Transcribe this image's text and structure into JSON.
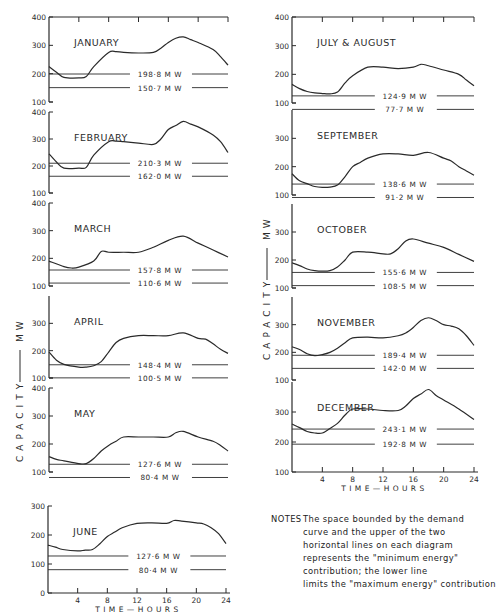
{
  "ylabel": "CAPACITY —— MW",
  "xlabel": "TIME — HOURS",
  "notes": {
    "header": "NOTES",
    "lines": [
      "The space bounded  by the demand",
      "curve  and  the  upper  of  the  two",
      "horizontal lines on each diagram",
      "represents the \"minimum energy\"",
      "contribution;  the lower line",
      "limits the \"maximum energy\" contribution"
    ]
  },
  "chart_data": [
    {
      "type": "line",
      "title": "JANUARY",
      "xlabel": "",
      "ylabel": "",
      "xlim": [
        0,
        24
      ],
      "ylim": [
        100,
        400
      ],
      "yticks": [
        100,
        200,
        300,
        400
      ],
      "x": [
        0,
        1,
        2,
        4,
        5,
        6,
        8,
        9,
        10,
        12,
        14,
        15,
        16,
        17,
        18,
        19,
        20,
        22,
        23,
        24
      ],
      "values": [
        225,
        205,
        187,
        185,
        190,
        225,
        275,
        278,
        275,
        273,
        275,
        290,
        310,
        325,
        330,
        320,
        310,
        285,
        260,
        230
      ],
      "hlines": [
        {
          "value": 198.8,
          "label": "198·8  M W"
        },
        {
          "value": 150.7,
          "label": "150·7  M W"
        }
      ]
    },
    {
      "type": "line",
      "title": "FEBRUARY",
      "xlim": [
        0,
        24
      ],
      "ylim": [
        100,
        400
      ],
      "yticks": [
        100,
        200,
        300,
        400
      ],
      "x": [
        0,
        1,
        2,
        4,
        5,
        6,
        8,
        9,
        10,
        12,
        14,
        15,
        16,
        17,
        18,
        19,
        20,
        22,
        23,
        24
      ],
      "values": [
        245,
        215,
        192,
        192,
        195,
        240,
        290,
        292,
        290,
        285,
        280,
        300,
        335,
        350,
        365,
        355,
        345,
        315,
        290,
        250
      ],
      "hlines": [
        {
          "value": 210.3,
          "label": "210·3  M W"
        },
        {
          "value": 162.0,
          "label": "162·0  M W"
        }
      ]
    },
    {
      "type": "line",
      "title": "MARCH",
      "xlim": [
        0,
        24
      ],
      "ylim": [
        100,
        400
      ],
      "yticks": [
        100,
        200,
        300,
        400
      ],
      "x": [
        0,
        2,
        3,
        4,
        6,
        7,
        8,
        10,
        12,
        14,
        16,
        18,
        20,
        22,
        24
      ],
      "values": [
        190,
        170,
        165,
        168,
        190,
        225,
        222,
        222,
        222,
        240,
        265,
        280,
        255,
        230,
        205
      ],
      "hlines": [
        {
          "value": 157.8,
          "label": "157·8  M W"
        },
        {
          "value": 110.6,
          "label": "110·6  M W"
        }
      ]
    },
    {
      "type": "line",
      "title": "APRIL",
      "xlim": [
        0,
        24
      ],
      "ylim": [
        100,
        400
      ],
      "yticks": [
        100,
        200,
        300
      ],
      "x": [
        0,
        1,
        2,
        4,
        5,
        6,
        7,
        8,
        9,
        10,
        12,
        14,
        16,
        18,
        20,
        21,
        22,
        23,
        24
      ],
      "values": [
        195,
        165,
        150,
        140,
        140,
        145,
        160,
        195,
        230,
        245,
        255,
        255,
        255,
        265,
        245,
        242,
        225,
        205,
        190
      ],
      "hlines": [
        {
          "value": 148.4,
          "label": "148·4  M W"
        },
        {
          "value": 100.5,
          "label": "100·5  M W"
        }
      ]
    },
    {
      "type": "line",
      "title": "MAY",
      "xlim": [
        0,
        24
      ],
      "ylim": [
        100,
        400
      ],
      "yticks": [
        100,
        200,
        300,
        400
      ],
      "x": [
        0,
        1,
        2,
        4,
        5,
        6,
        7,
        8,
        9,
        10,
        12,
        14,
        16,
        17,
        18,
        20,
        22,
        23,
        24
      ],
      "values": [
        155,
        145,
        140,
        130,
        130,
        148,
        175,
        195,
        210,
        225,
        225,
        225,
        225,
        240,
        245,
        225,
        210,
        195,
        175
      ],
      "hlines": [
        {
          "value": 127.6,
          "label": "127·6  M W"
        },
        {
          "value": 80.4,
          "label": "80·4  M W"
        }
      ]
    },
    {
      "type": "line",
      "title": "JUNE",
      "xlim": [
        0,
        24
      ],
      "ylim": [
        0,
        300
      ],
      "yticks": [
        0,
        100,
        200,
        300
      ],
      "xticks": [
        4,
        8,
        12,
        16,
        20,
        24
      ],
      "x": [
        0,
        1,
        2,
        4,
        5,
        6,
        7,
        8,
        9,
        10,
        12,
        14,
        16,
        17,
        18,
        20,
        21,
        22,
        23,
        24
      ],
      "values": [
        165,
        158,
        150,
        145,
        148,
        150,
        170,
        195,
        210,
        225,
        240,
        242,
        240,
        250,
        248,
        242,
        238,
        225,
        205,
        170
      ],
      "hlines": [
        {
          "value": 127.6,
          "label": "127·6  M W"
        },
        {
          "value": 80.4,
          "label": "80·4  M W"
        }
      ]
    },
    {
      "type": "line",
      "title": "JULY & AUGUST",
      "xlim": [
        0,
        24
      ],
      "ylim": [
        100,
        400
      ],
      "yticks": [
        100,
        200,
        300,
        400
      ],
      "x": [
        0,
        1,
        2,
        3,
        4,
        5,
        6,
        7,
        8,
        10,
        12,
        14,
        16,
        17,
        18,
        20,
        22,
        23,
        24
      ],
      "values": [
        165,
        150,
        140,
        135,
        133,
        132,
        138,
        170,
        195,
        225,
        225,
        220,
        225,
        235,
        230,
        215,
        200,
        180,
        160
      ],
      "hlines": [
        {
          "value": 124.9,
          "label": "124·9  M W"
        },
        {
          "value": 77.7,
          "label": "77·7  M W"
        }
      ]
    },
    {
      "type": "line",
      "title": "SEPTEMBER",
      "xlim": [
        0,
        24
      ],
      "ylim": [
        100,
        400
      ],
      "yticks": [
        100,
        200,
        300
      ],
      "x": [
        0,
        1,
        2,
        3,
        4,
        5,
        6,
        7,
        8,
        9,
        10,
        12,
        14,
        16,
        18,
        20,
        21,
        22,
        23,
        24
      ],
      "values": [
        175,
        150,
        140,
        130,
        127,
        128,
        135,
        165,
        200,
        215,
        230,
        245,
        245,
        240,
        250,
        230,
        220,
        200,
        185,
        170
      ],
      "hlines": [
        {
          "value": 138.6,
          "label": "138·6  M W"
        },
        {
          "value": 91.2,
          "label": "91·2  M W"
        }
      ]
    },
    {
      "type": "line",
      "title": "OCTOBER",
      "xlim": [
        0,
        24
      ],
      "ylim": [
        100,
        400
      ],
      "yticks": [
        100,
        200,
        300
      ],
      "x": [
        0,
        1,
        2,
        3,
        4,
        5,
        6,
        7,
        8,
        10,
        12,
        13,
        14,
        15,
        16,
        18,
        20,
        22,
        24
      ],
      "values": [
        190,
        180,
        168,
        162,
        160,
        162,
        175,
        200,
        228,
        228,
        222,
        222,
        240,
        268,
        275,
        260,
        245,
        220,
        195
      ],
      "hlines": [
        {
          "value": 155.6,
          "label": "155·6  M W"
        },
        {
          "value": 108.5,
          "label": "108·5  M W"
        }
      ]
    },
    {
      "type": "line",
      "title": "NOVEMBER",
      "xlim": [
        0,
        24
      ],
      "ylim": [
        100,
        400
      ],
      "yticks": [
        100,
        200,
        300
      ],
      "x": [
        0,
        1,
        2,
        3,
        4,
        5,
        6,
        7,
        8,
        10,
        12,
        14,
        15,
        16,
        17,
        18,
        19,
        20,
        21,
        22,
        23,
        24
      ],
      "values": [
        220,
        210,
        195,
        188,
        192,
        200,
        215,
        235,
        252,
        255,
        252,
        260,
        270,
        290,
        315,
        325,
        315,
        300,
        295,
        285,
        260,
        225
      ],
      "hlines": [
        {
          "value": 189.4,
          "label": "189·4  M W"
        },
        {
          "value": 142.0,
          "label": "142·0  M W"
        }
      ]
    },
    {
      "type": "line",
      "title": "DECEMBER",
      "xlim": [
        0,
        24
      ],
      "ylim": [
        100,
        400
      ],
      "yticks": [
        100,
        200,
        300
      ],
      "xticks": [
        4,
        8,
        12,
        16,
        20,
        24
      ],
      "x": [
        0,
        1,
        2,
        3,
        4,
        5,
        6,
        7,
        8,
        10,
        12,
        14,
        15,
        16,
        17,
        18,
        19,
        20,
        22,
        24
      ],
      "values": [
        260,
        248,
        235,
        230,
        230,
        245,
        262,
        290,
        310,
        310,
        305,
        305,
        320,
        345,
        360,
        375,
        355,
        340,
        310,
        275
      ],
      "hlines": [
        {
          "value": 243.1,
          "label": "243·1  M W"
        },
        {
          "value": 192.8,
          "label": "192·8  M W"
        }
      ]
    }
  ],
  "layout": [
    {
      "x0": 49,
      "x1": 228,
      "top": 17,
      "bottom": 102,
      "yMin": 100,
      "yMax": 400,
      "topTicks": true,
      "xTicks": false
    },
    {
      "x0": 49,
      "x1": 228,
      "top": 112,
      "bottom": 193,
      "yMin": 100,
      "yMax": 400,
      "topTicks": false,
      "xTicks": false
    },
    {
      "x0": 49,
      "x1": 228,
      "top": 203,
      "bottom": 286,
      "yMin": 100,
      "yMax": 400,
      "topTicks": false,
      "xTicks": false
    },
    {
      "x0": 49,
      "x1": 228,
      "top": 296,
      "bottom": 378,
      "yMin": 100,
      "yMax": 400,
      "topTicks": false,
      "xTicks": false
    },
    {
      "x0": 49,
      "x1": 228,
      "top": 388,
      "bottom": 472,
      "yMin": 100,
      "yMax": 400,
      "topTicks": false,
      "xTicks": false
    },
    {
      "x0": 48,
      "x1": 226,
      "top": 506,
      "bottom": 593,
      "yMin": 0,
      "yMax": 300,
      "topTicks": false,
      "xTicks": true
    },
    {
      "x0": 292,
      "x1": 474,
      "top": 17,
      "bottom": 103,
      "yMin": 100,
      "yMax": 400,
      "topTicks": true,
      "xTicks": false
    },
    {
      "x0": 292,
      "x1": 474,
      "top": 110,
      "bottom": 195,
      "yMin": 100,
      "yMax": 400,
      "topTicks": false,
      "xTicks": false
    },
    {
      "x0": 292,
      "x1": 474,
      "top": 204,
      "bottom": 288,
      "yMin": 100,
      "yMax": 400,
      "topTicks": false,
      "xTicks": false
    },
    {
      "x0": 292,
      "x1": 474,
      "top": 297,
      "bottom": 380,
      "yMin": 100,
      "yMax": 400,
      "topTicks": false,
      "xTicks": false
    },
    {
      "x0": 292,
      "x1": 474,
      "top": 382,
      "bottom": 472,
      "yMin": 100,
      "yMax": 400,
      "topTicks": false,
      "xTicks": true
    }
  ]
}
